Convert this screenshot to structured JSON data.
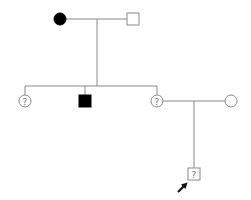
{
  "diagram": {
    "type": "pedigree",
    "colors": {
      "line": "#8a8a8a",
      "affected": "#000000",
      "unaffected": "#ffffff",
      "arrow": "#111111"
    },
    "generation1": {
      "mother": {
        "sex": "female",
        "status": "affected",
        "label": ""
      },
      "father": {
        "sex": "male",
        "status": "unaffected",
        "label": ""
      }
    },
    "generation2": [
      {
        "sex": "female",
        "status": "unknown",
        "label": "?"
      },
      {
        "sex": "male",
        "status": "affected",
        "label": ""
      },
      {
        "sex": "female",
        "status": "unknown",
        "label": "?"
      },
      {
        "sex": "female",
        "status": "unaffected",
        "label": "",
        "relation": "spouse"
      }
    ],
    "generation3": [
      {
        "sex": "male",
        "status": "unknown",
        "label": "?",
        "proband": true
      }
    ]
  }
}
